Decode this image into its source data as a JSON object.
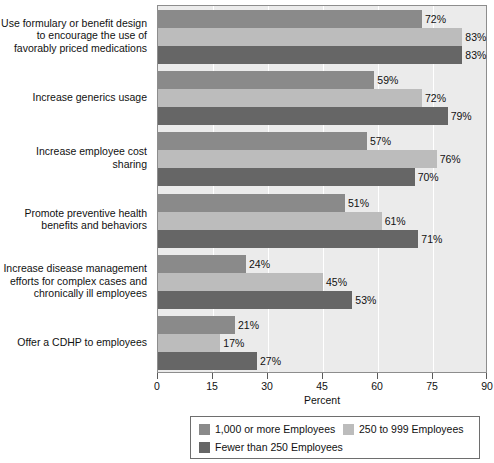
{
  "chart_data": {
    "type": "bar",
    "orientation": "horizontal",
    "title": "",
    "xlabel": "Percent",
    "ylabel": "",
    "xlim": [
      0,
      90
    ],
    "xticks": [
      "0",
      "15",
      "30",
      "45",
      "60",
      "75",
      "90"
    ],
    "grid": true,
    "legend_position": "bottom",
    "value_suffix": "%",
    "categories": [
      "Use formulary or benefit design to encourage the use of favorably priced medications",
      "Increase generics usage",
      "Increase employee cost sharing",
      "Promote preventive health benefits and behaviors",
      "Increase disease management efforts for complex cases and chronically ill employees",
      "Offer a CDHP to employees"
    ],
    "category_lines": [
      [
        "Use formulary or benefit design",
        "to encourage the use of",
        "favorably priced medications"
      ],
      [
        "Increase generics usage"
      ],
      [
        "Increase employee cost sharing"
      ],
      [
        "Promote preventive health",
        "benefits and behaviors"
      ],
      [
        "Increase disease management",
        "efforts for complex cases and",
        "chronically ill employees"
      ],
      [
        "Offer a CDHP to employees"
      ]
    ],
    "series": [
      {
        "name": "1,000 or more Employees",
        "color": "#8a8a8a",
        "values": [
          72,
          59,
          57,
          51,
          24,
          21
        ],
        "labels": [
          "72%",
          "59%",
          "57%",
          "51%",
          "24%",
          "21%"
        ]
      },
      {
        "name": "250 to 999 Employees",
        "color": "#bcbcbc",
        "values": [
          83,
          72,
          76,
          61,
          45,
          17
        ],
        "labels": [
          "83%",
          "72%",
          "76%",
          "61%",
          "45%",
          "17%"
        ]
      },
      {
        "name": "Fewer than 250 Employees",
        "color": "#666666",
        "values": [
          83,
          79,
          70,
          71,
          53,
          27
        ],
        "labels": [
          "83%",
          "79%",
          "70%",
          "71%",
          "53%",
          "27%"
        ]
      }
    ]
  }
}
